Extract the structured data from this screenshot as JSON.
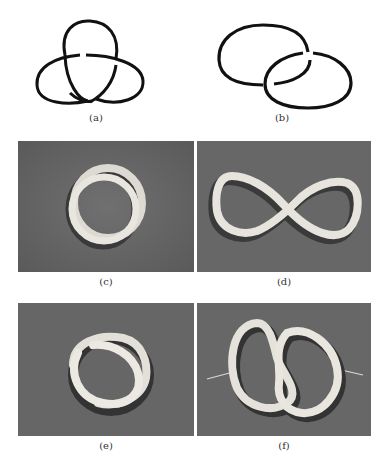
{
  "figure": {
    "panels": [
      {
        "id": "a",
        "caption": "(a)",
        "kind": "drawing",
        "subject": "trefoil knot diagram"
      },
      {
        "id": "b",
        "caption": "(b)",
        "kind": "drawing",
        "subject": "Hopf link diagram (two linked rings)"
      },
      {
        "id": "c",
        "caption": "(c)",
        "kind": "photo",
        "subject": "tube coiled into a double loop"
      },
      {
        "id": "d",
        "caption": "(d)",
        "kind": "photo",
        "subject": "tube in figure-eight (infinity) shape"
      },
      {
        "id": "e",
        "caption": "(e)",
        "kind": "photo",
        "subject": "tube forming a trefoil-like twisted loop"
      },
      {
        "id": "f",
        "caption": "(f)",
        "kind": "photo",
        "subject": "tube knotted into a linked double loop with pins"
      }
    ],
    "colors": {
      "ink": "#111111",
      "background_cloth": "#6a6a6a",
      "tube": "#e6e4dc"
    }
  }
}
